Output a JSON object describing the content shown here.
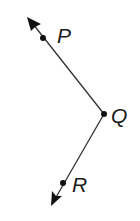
{
  "diagram": {
    "type": "angle-with-rays",
    "colors": {
      "stroke": "#333333",
      "point": "#111111",
      "label": "#1a1a1a",
      "background": "#ffffff"
    },
    "points": [
      {
        "id": "P",
        "label": "P",
        "x": 43,
        "y": 38
      },
      {
        "id": "Q",
        "label": "Q",
        "x": 104,
        "y": 114
      },
      {
        "id": "R",
        "label": "R",
        "x": 63,
        "y": 183
      }
    ],
    "rays": [
      {
        "id": "ray-QP",
        "from": "Q",
        "through": "P",
        "arrow_tip": {
          "x": 27,
          "y": 17
        }
      },
      {
        "id": "ray-QR",
        "from": "Q",
        "through": "R",
        "arrow_tip": {
          "x": 51,
          "y": 206
        }
      }
    ],
    "labels": {
      "p": "P",
      "q": "Q",
      "r": "R"
    }
  }
}
